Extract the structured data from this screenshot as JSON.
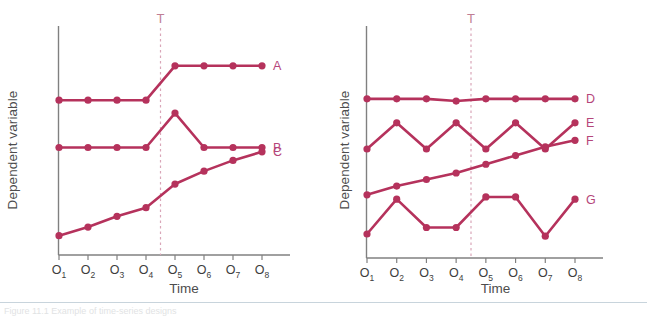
{
  "figure": {
    "caption": "Figure 11.1   Example of time-series designs",
    "accent_color": "#b5325c",
    "axis_color": "#808080",
    "dashed_color": "#d9a6b8",
    "label_color": "#b5457a"
  },
  "panels": [
    {
      "id": "left",
      "ylabel": "Dependent variable",
      "xlabel": "Time",
      "intervention_label": "T",
      "ticks": [
        {
          "base": "O",
          "sub": "1"
        },
        {
          "base": "O",
          "sub": "2"
        },
        {
          "base": "O",
          "sub": "3"
        },
        {
          "base": "O",
          "sub": "4"
        },
        {
          "base": "O",
          "sub": "5"
        },
        {
          "base": "O",
          "sub": "6"
        },
        {
          "base": "O",
          "sub": "7"
        },
        {
          "base": "O",
          "sub": "8"
        }
      ],
      "series_labels": [
        "A",
        "B",
        "C"
      ]
    },
    {
      "id": "right",
      "ylabel": "Dependent variable",
      "xlabel": "Time",
      "intervention_label": "T",
      "ticks": [
        {
          "base": "O",
          "sub": "1"
        },
        {
          "base": "O",
          "sub": "2"
        },
        {
          "base": "O",
          "sub": "3"
        },
        {
          "base": "O",
          "sub": "4"
        },
        {
          "base": "O",
          "sub": "5"
        },
        {
          "base": "O",
          "sub": "6"
        },
        {
          "base": "O",
          "sub": "7"
        },
        {
          "base": "O",
          "sub": "8"
        }
      ],
      "series_labels": [
        "D",
        "E",
        "F",
        "G"
      ]
    }
  ],
  "chart_data": [
    {
      "type": "line",
      "panel": "left",
      "title": "",
      "xlabel": "Time",
      "ylabel": "Dependent variable",
      "categories": [
        "O1",
        "O2",
        "O3",
        "O4",
        "O5",
        "O6",
        "O7",
        "O8"
      ],
      "ylim": [
        0,
        100
      ],
      "grid": false,
      "legend": "right-of-line-end",
      "annotations": [
        {
          "text": "T",
          "type": "vertical-dashed-line",
          "x_between": [
            "O4",
            "O5"
          ]
        }
      ],
      "series": [
        {
          "name": "A",
          "values": [
            72,
            72,
            72,
            72,
            88,
            88,
            88,
            88
          ]
        },
        {
          "name": "B",
          "values": [
            50,
            50,
            50,
            50,
            66,
            50,
            50,
            50
          ]
        },
        {
          "name": "C",
          "values": [
            9,
            13,
            18,
            22,
            33,
            39,
            44,
            48
          ]
        }
      ]
    },
    {
      "type": "line",
      "panel": "right",
      "title": "",
      "xlabel": "Time",
      "ylabel": "Dependent variable",
      "categories": [
        "O1",
        "O2",
        "O3",
        "O4",
        "O5",
        "O6",
        "O7",
        "O8"
      ],
      "ylim": [
        0,
        100
      ],
      "grid": false,
      "legend": "right-of-line-end",
      "annotations": [
        {
          "text": "T",
          "type": "vertical-dashed-line",
          "x_between": [
            "O4",
            "O5"
          ]
        }
      ],
      "series": [
        {
          "name": "D",
          "values": [
            73,
            73,
            73,
            72,
            73,
            73,
            73,
            73
          ]
        },
        {
          "name": "E",
          "values": [
            50,
            62,
            50,
            62,
            50,
            62,
            50,
            62
          ]
        },
        {
          "name": "F",
          "values": [
            29,
            33,
            36,
            39,
            43,
            47,
            51,
            54
          ]
        },
        {
          "name": "G",
          "values": [
            11,
            27,
            14,
            14,
            28,
            28,
            10,
            27
          ]
        }
      ]
    }
  ]
}
